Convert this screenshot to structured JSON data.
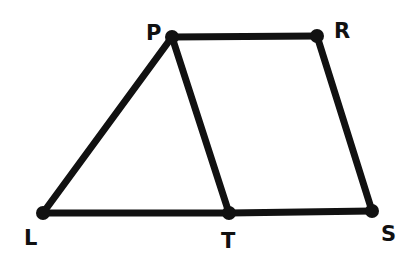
{
  "diagram": {
    "type": "geometry",
    "stroke_color": "#111111",
    "background": "#ffffff",
    "points": [
      {
        "name": "P",
        "x": 172,
        "y": 37,
        "label_x": 146,
        "label_y": 40
      },
      {
        "name": "R",
        "x": 317,
        "y": 36,
        "label_x": 334,
        "label_y": 38
      },
      {
        "name": "L",
        "x": 43,
        "y": 213,
        "label_x": 24,
        "label_y": 245
      },
      {
        "name": "T",
        "x": 229,
        "y": 213,
        "label_x": 221,
        "label_y": 248
      },
      {
        "name": "S",
        "x": 372,
        "y": 211,
        "label_x": 381,
        "label_y": 241
      }
    ],
    "segments": [
      [
        "P",
        "R"
      ],
      [
        "R",
        "S"
      ],
      [
        "S",
        "T"
      ],
      [
        "T",
        "L"
      ],
      [
        "L",
        "P"
      ],
      [
        "P",
        "T"
      ]
    ],
    "labels": {
      "P": "P",
      "R": "R",
      "L": "L",
      "T": "T",
      "S": "S"
    }
  }
}
